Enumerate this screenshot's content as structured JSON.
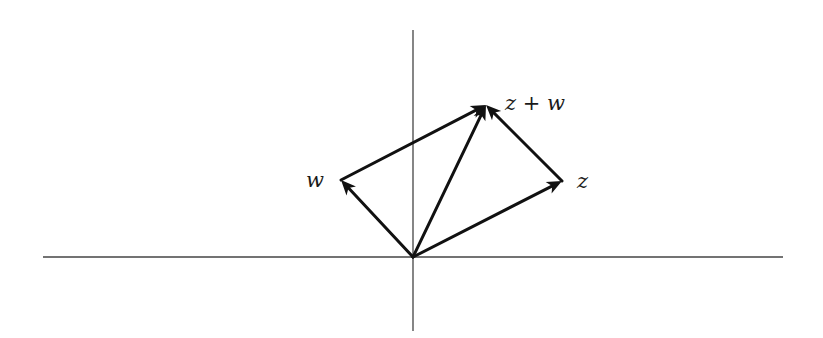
{
  "diagram": {
    "type": "vector-addition-parallelogram",
    "origin": {
      "x": 413,
      "y": 257
    },
    "axes": {
      "horizontal": {
        "x1": 43,
        "x2": 783,
        "y": 257
      },
      "vertical": {
        "x": 413,
        "y1": 30,
        "y2": 331
      },
      "color": "#444444"
    },
    "points": {
      "w": {
        "x": 341,
        "y": 180
      },
      "z": {
        "x": 562,
        "y": 181
      },
      "z_plus_w": {
        "x": 486,
        "y": 105
      }
    },
    "arrows": [
      {
        "name": "vector-w",
        "from": "origin",
        "to": "w"
      },
      {
        "name": "vector-z",
        "from": "origin",
        "to": "z"
      },
      {
        "name": "vector-z-plus-w",
        "from": "origin",
        "to": "z_plus_w"
      },
      {
        "name": "vector-z-from-w",
        "from": "w",
        "to": "z_plus_w"
      },
      {
        "name": "vector-w-from-z",
        "from": "z",
        "to": "z_plus_w"
      }
    ],
    "arrow_color": "#111111",
    "labels": {
      "w": "w",
      "z": "z",
      "z_plus_w": "z + w"
    }
  }
}
